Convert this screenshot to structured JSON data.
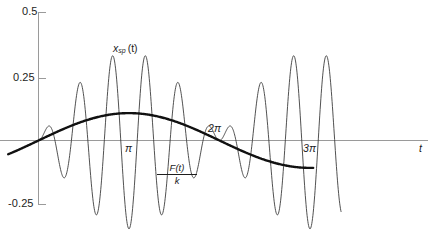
{
  "chart_data": {
    "type": "line",
    "title": "",
    "xlabel": "t",
    "ylabel": "",
    "xlim": [
      -0.45,
      4.55
    ],
    "ylim": [
      -0.34,
      0.5
    ],
    "grid": false,
    "legend_position": "inline-annotations",
    "x_unit": "pi",
    "x_tick_labels": [
      "π",
      "2π",
      "3π"
    ],
    "x_tick_values": [
      1,
      2,
      3
    ],
    "y_tick_labels": [
      "0.5",
      "0.25",
      "-0.25"
    ],
    "y_tick_values": [
      0.5,
      0.25,
      -0.25
    ],
    "annotations": {
      "oscillation_label": "x",
      "oscillation_label_sub": "sp",
      "oscillation_label_arg": "(t)",
      "forcing_numerator": "F(t)",
      "forcing_denominator": "k",
      "axis_label_t": "t"
    },
    "series": [
      {
        "name": "x_sp(t)",
        "style": "thin",
        "color": "#3d3d3d",
        "width": 0.9,
        "description": "Beat oscillation: fast carrier modulated by slow envelope, drawn from t=0 to t=3.33pi",
        "x": [
          0.0,
          0.02,
          0.04,
          0.06,
          0.08,
          0.1,
          0.12,
          0.14,
          0.16,
          0.18,
          0.2,
          0.22,
          0.24,
          0.26,
          0.28,
          0.3,
          0.32,
          0.34,
          0.36,
          0.38,
          0.4,
          0.42,
          0.44,
          0.46,
          0.48,
          0.5,
          0.52,
          0.54,
          0.56,
          0.58,
          0.6,
          0.62,
          0.64,
          0.66,
          0.68,
          0.7,
          0.72,
          0.74,
          0.76,
          0.78,
          0.8,
          0.82,
          0.84,
          0.86,
          0.88,
          0.9,
          0.92,
          0.94,
          0.96,
          0.98,
          1.0,
          1.02,
          1.04,
          1.06,
          1.08,
          1.1,
          1.12,
          1.14,
          1.16,
          1.18,
          1.2,
          1.22,
          1.24,
          1.26,
          1.28,
          1.3,
          1.32,
          1.34,
          1.36,
          1.38,
          1.4,
          1.42,
          1.44,
          1.46,
          1.48,
          1.5,
          1.52,
          1.54,
          1.56,
          1.58,
          1.6,
          1.62,
          1.64,
          1.66,
          1.68,
          1.7,
          1.72,
          1.74,
          1.76,
          1.78,
          1.8,
          1.82,
          1.84,
          1.86,
          1.88,
          1.9,
          1.92,
          1.94,
          1.96,
          1.98,
          2.0,
          2.02,
          2.04,
          2.06,
          2.08,
          2.1,
          2.12,
          2.14,
          2.16,
          2.18,
          2.2,
          2.22,
          2.24,
          2.26,
          2.28,
          2.3,
          2.32,
          2.34,
          2.36,
          2.38,
          2.4,
          2.42,
          2.44,
          2.46,
          2.48,
          2.5,
          2.52,
          2.54,
          2.56,
          2.58,
          2.6,
          2.62,
          2.64,
          2.66,
          2.68,
          2.7,
          2.72,
          2.74,
          2.76,
          2.78,
          2.8,
          2.82,
          2.84,
          2.86,
          2.88,
          2.9,
          2.92,
          2.94,
          2.96,
          2.98,
          3.0,
          3.02,
          3.04,
          3.06,
          3.08,
          3.1,
          3.12,
          3.14,
          3.16,
          3.18,
          3.2,
          3.22,
          3.24,
          3.26,
          3.28,
          3.3,
          3.32
        ],
        "note": "y computed as 0.31*sin(0.5*pi*x)*sin(5.5*pi*x) scaled; see rendered path"
      },
      {
        "name": "F(t)/k",
        "style": "thick",
        "color": "#111111",
        "width": 2.4,
        "description": "Slow forcing sinusoid, amplitude approx 0.105, period 2pi, drawn from t=-0.33pi to t=3.05pi"
      }
    ],
    "axis_color": "#9a9a9a",
    "background": "#ffffff"
  },
  "figure": {
    "y_axis_ticks": [
      {
        "label": "0.5",
        "value": 0.5
      },
      {
        "label": "0.25",
        "value": 0.25
      },
      {
        "label": "-0.25",
        "value": -0.25
      }
    ],
    "x_axis_ticks": [
      {
        "label": "π",
        "value": 1
      },
      {
        "label": "2π",
        "value": 2
      },
      {
        "label": "3π",
        "value": 3
      }
    ],
    "labels": {
      "x_sp_main": "x",
      "x_sp_sub": "sp",
      "x_sp_paren": "(t)",
      "forcing_num": "F(t)",
      "forcing_den": "k",
      "t_axis": "t"
    }
  }
}
